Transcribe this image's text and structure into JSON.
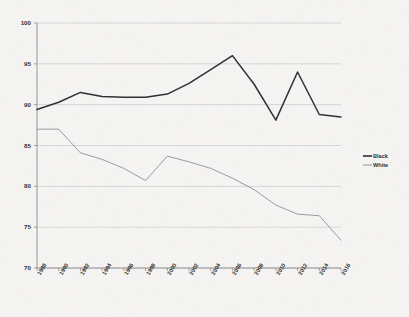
{
  "chart_data": {
    "type": "line",
    "title": "",
    "subtitle": "",
    "xlabel": "",
    "ylabel": "",
    "x": [
      1988,
      1990,
      1992,
      1994,
      1996,
      1998,
      2000,
      2002,
      2004,
      2006,
      2008,
      2010,
      2012,
      2014,
      2016
    ],
    "xtick_labels": [
      "1988",
      "1990",
      "1992",
      "1994",
      "1996",
      "1998",
      "2000",
      "2002",
      "2004",
      "2006",
      "2008",
      "2010",
      "2012",
      "2014",
      "2016"
    ],
    "ytick_labels": [
      "70",
      "75",
      "80",
      "85",
      "90",
      "95",
      "100"
    ],
    "yticks": [
      70,
      75,
      80,
      85,
      90,
      95,
      100
    ],
    "ylim": [
      70,
      100
    ],
    "xlim": [
      1988,
      2016
    ],
    "grid": true,
    "grid_axis": "y",
    "legend_position": "right",
    "series": [
      {
        "name": "Black",
        "color": "#2b2b2b",
        "values": [
          89.4,
          90.3,
          91.5,
          91.0,
          90.9,
          90.9,
          91.3,
          92.6,
          94.3,
          96.0,
          92.5,
          88.1,
          94.0,
          88.8,
          88.5
        ]
      },
      {
        "name": "White",
        "color": "#9a9a9a",
        "values": [
          87.0,
          87.0,
          84.1,
          83.3,
          82.2,
          80.7,
          83.7,
          83.0,
          82.2,
          81.0,
          79.6,
          77.7,
          76.6,
          76.4,
          73.4
        ]
      }
    ]
  },
  "legend": {
    "items": [
      {
        "label": "Black",
        "color": "#2b2b2b"
      },
      {
        "label": "White",
        "color": "#9a9a9a"
      }
    ]
  },
  "colors": {
    "background": "#f7f6f4",
    "gridline": "#c9c9c9",
    "axis": "#8a8a8a",
    "black_series": "#2b2b2b",
    "white_series": "#9a9a9a",
    "tick_text": "#2b2b2b"
  }
}
